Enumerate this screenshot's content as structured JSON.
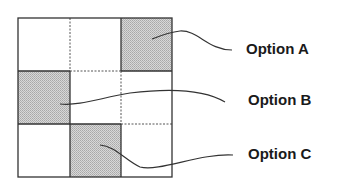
{
  "diagram": {
    "grid": {
      "rows": 3,
      "cols": 3,
      "x0": 18,
      "y0": 18,
      "cell_w": 51.3,
      "cell_h": 53,
      "shaded_cells": [
        {
          "row": 0,
          "col": 2,
          "option": "A"
        },
        {
          "row": 1,
          "col": 0,
          "option": "B"
        },
        {
          "row": 2,
          "col": 1,
          "option": "C"
        }
      ],
      "shade_color": "#c6c6c6",
      "border_color": "#333333",
      "dotted_color": "#555555"
    },
    "callouts": [
      {
        "id": "A",
        "label": "Option A",
        "label_x": 246,
        "label_y": 40
      },
      {
        "id": "B",
        "label": "Option B",
        "label_x": 248,
        "label_y": 91
      },
      {
        "id": "C",
        "label": "Option C",
        "label_x": 248,
        "label_y": 145
      }
    ]
  }
}
